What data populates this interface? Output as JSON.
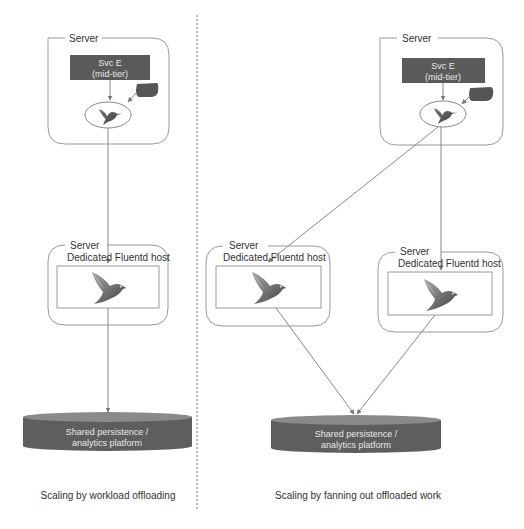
{
  "diagram": {
    "left_panel": {
      "caption": "Scaling by workload offloading",
      "server_top": {
        "label": "Server",
        "service": {
          "line1": "Svc E",
          "line2": "(mid-tier)"
        },
        "agent_icon": "hummingbird-icon",
        "log_bubble_icon": "speech-bubble-icon"
      },
      "fluentd_host": {
        "server_label": "Server",
        "title": "Dedicated Fluentd host",
        "icon": "fluentd-bird-icon"
      },
      "storage": {
        "line1": "Shared persistence /",
        "line2": "analytics platform"
      }
    },
    "right_panel": {
      "caption": "Scaling by fanning out offloaded work",
      "server_top": {
        "label": "Server",
        "service": {
          "line1": "Svc E",
          "line2": "(mid-tier)"
        },
        "agent_icon": "hummingbird-icon",
        "log_bubble_icon": "speech-bubble-icon"
      },
      "fluentd_hosts": [
        {
          "server_label": "Server",
          "title": "Dedicated Fluentd host",
          "icon": "fluentd-bird-icon"
        },
        {
          "server_label": "Server",
          "title": "Dedicated Fluentd host",
          "icon": "fluentd-bird-icon"
        }
      ],
      "storage": {
        "line1": "Shared persistence /",
        "line2": "analytics platform"
      }
    },
    "colors": {
      "service_box": "#5a5a5a",
      "cylinder_body": "#5e5e5e",
      "cylinder_top": "#8a8a8a",
      "lines": "#888888",
      "bird_dark": "#4d4d4d",
      "bird_light": "#9a9a9a"
    }
  }
}
